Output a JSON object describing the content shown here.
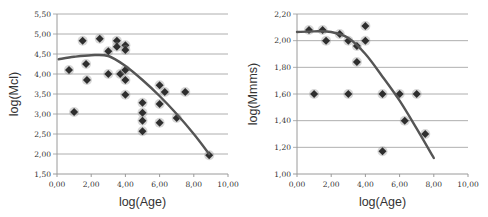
{
  "chart_data": [
    {
      "type": "scatter",
      "title": "",
      "xlabel": "log(Age)",
      "ylabel": "log(Mcl)",
      "xlim": [
        0,
        10
      ],
      "ylim": [
        1.5,
        5.5
      ],
      "x_ticks": [
        "0,00",
        "2,00",
        "4,00",
        "6,00",
        "8,00",
        "10,00"
      ],
      "y_ticks": [
        "1,50",
        "2,00",
        "2,50",
        "3,00",
        "3,50",
        "4,00",
        "4,50",
        "5,00",
        "5,50"
      ],
      "grid": "horizontal",
      "legend": "none",
      "series": [
        {
          "name": "data",
          "points": [
            [
              0.7,
              4.1
            ],
            [
              1.0,
              3.05
            ],
            [
              1.5,
              4.83
            ],
            [
              1.7,
              4.25
            ],
            [
              1.75,
              3.85
            ],
            [
              2.5,
              4.88
            ],
            [
              3.0,
              4.57
            ],
            [
              3.0,
              4.0
            ],
            [
              3.5,
              4.83
            ],
            [
              3.5,
              4.68
            ],
            [
              3.7,
              4.0
            ],
            [
              4.0,
              4.72
            ],
            [
              4.0,
              4.6
            ],
            [
              4.0,
              4.1
            ],
            [
              4.0,
              3.85
            ],
            [
              4.0,
              3.48
            ],
            [
              5.0,
              3.28
            ],
            [
              5.0,
              3.03
            ],
            [
              5.0,
              2.83
            ],
            [
              5.0,
              2.57
            ],
            [
              6.0,
              3.72
            ],
            [
              6.0,
              3.25
            ],
            [
              6.0,
              2.78
            ],
            [
              6.3,
              3.55
            ],
            [
              7.0,
              2.9
            ],
            [
              7.5,
              3.55
            ],
            [
              8.9,
              1.97
            ]
          ]
        },
        {
          "name": "trend",
          "kind": "line",
          "points": [
            [
              0.1,
              4.37
            ],
            [
              1.0,
              4.43
            ],
            [
              2.0,
              4.47
            ],
            [
              3.0,
              4.45
            ],
            [
              4.0,
              4.2
            ],
            [
              5.0,
              3.85
            ],
            [
              6.0,
              3.45
            ],
            [
              7.0,
              3.0
            ],
            [
              8.0,
              2.5
            ],
            [
              8.9,
              2.0
            ]
          ]
        }
      ]
    },
    {
      "type": "scatter",
      "title": "",
      "xlabel": "log(Age)",
      "ylabel": "log(Mmms)",
      "xlim": [
        0,
        10
      ],
      "ylim": [
        1.0,
        2.2
      ],
      "x_ticks": [
        "0,00",
        "2,00",
        "4,00",
        "6,00",
        "8,00",
        "10,00"
      ],
      "y_ticks": [
        "1,00",
        "1,20",
        "1,40",
        "1,60",
        "1,80",
        "2,00",
        "2,20"
      ],
      "grid": "horizontal",
      "legend": "none",
      "series": [
        {
          "name": "data",
          "points": [
            [
              0.7,
              2.08
            ],
            [
              1.0,
              1.6
            ],
            [
              1.5,
              2.08
            ],
            [
              1.7,
              2.0
            ],
            [
              2.5,
              2.05
            ],
            [
              3.0,
              2.0
            ],
            [
              3.0,
              1.6
            ],
            [
              3.5,
              1.96
            ],
            [
              3.5,
              1.84
            ],
            [
              4.0,
              2.11
            ],
            [
              4.0,
              2.0
            ],
            [
              5.0,
              1.6
            ],
            [
              5.0,
              1.17
            ],
            [
              6.0,
              1.6
            ],
            [
              6.3,
              1.4
            ],
            [
              7.0,
              1.6
            ],
            [
              7.5,
              1.3
            ]
          ]
        },
        {
          "name": "trend",
          "kind": "line",
          "points": [
            [
              0.0,
              2.065
            ],
            [
              1.0,
              2.07
            ],
            [
              2.0,
              2.065
            ],
            [
              3.0,
              2.02
            ],
            [
              4.0,
              1.9
            ],
            [
              5.0,
              1.73
            ],
            [
              6.0,
              1.55
            ],
            [
              7.0,
              1.34
            ],
            [
              8.0,
              1.12
            ]
          ]
        }
      ]
    }
  ]
}
